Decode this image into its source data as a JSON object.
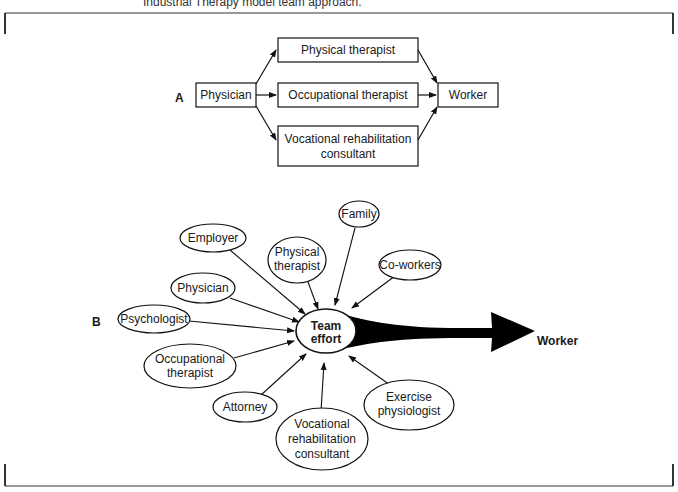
{
  "caption": "Industrial Therapy model team approach.",
  "panel_a": {
    "label": "A",
    "source": "Physician",
    "intermediates": [
      {
        "label_lines": [
          "Physical therapist"
        ]
      },
      {
        "label_lines": [
          "Occupational therapist"
        ]
      },
      {
        "label_lines": [
          "Vocational rehabilitation",
          "consultant"
        ]
      }
    ],
    "target": "Worker"
  },
  "panel_b": {
    "label": "B",
    "hub": {
      "label_lines": [
        "Team",
        "effort"
      ]
    },
    "target": "Worker",
    "contributors": [
      {
        "name": "Employer",
        "label_lines": [
          "Employer"
        ]
      },
      {
        "name": "Physical therapist",
        "label_lines": [
          "Physical",
          "therapist"
        ]
      },
      {
        "name": "Family",
        "label_lines": [
          "Family"
        ]
      },
      {
        "name": "Co-workers",
        "label_lines": [
          "Co-workers"
        ]
      },
      {
        "name": "Physician",
        "label_lines": [
          "Physician"
        ]
      },
      {
        "name": "Psychologist",
        "label_lines": [
          "Psychologist"
        ]
      },
      {
        "name": "Occupational therapist",
        "label_lines": [
          "Occupational",
          "therapist"
        ]
      },
      {
        "name": "Attorney",
        "label_lines": [
          "Attorney"
        ]
      },
      {
        "name": "Vocational rehabilitation consultant",
        "label_lines": [
          "Vocational",
          "rehabilitation",
          "consultant"
        ]
      },
      {
        "name": "Exercise physiologist",
        "label_lines": [
          "Exercise",
          "physiologist"
        ]
      }
    ]
  }
}
